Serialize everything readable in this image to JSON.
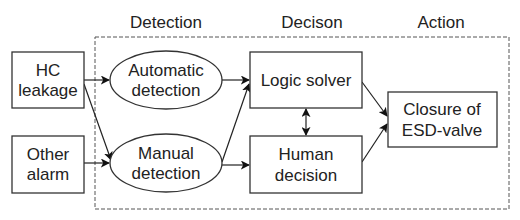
{
  "headers": {
    "detection": "Detection",
    "decision": "Decison",
    "action": "Action"
  },
  "nodes": {
    "hc_leakage": {
      "line1": "HC",
      "line2": "leakage"
    },
    "other_alarm": {
      "line1": "Other",
      "line2": "alarm"
    },
    "automatic_detection": {
      "line1": "Automatic",
      "line2": "detection"
    },
    "manual_detection": {
      "line1": "Manual",
      "line2": "detection"
    },
    "logic_solver": {
      "line1": "Logic solver"
    },
    "human_decision": {
      "line1": "Human",
      "line2": "decision"
    },
    "closure": {
      "line1": "Closure of",
      "line2": "ESD-valve"
    }
  },
  "edges": [
    {
      "from": "HC leakage",
      "to": "Automatic detection"
    },
    {
      "from": "HC leakage",
      "to": "Manual detection"
    },
    {
      "from": "Other alarm",
      "to": "Manual detection"
    },
    {
      "from": "Automatic detection",
      "to": "Logic solver"
    },
    {
      "from": "Manual detection",
      "to": "Logic solver"
    },
    {
      "from": "Manual detection",
      "to": "Human decision"
    },
    {
      "from": "Logic solver",
      "to": "Human decision",
      "bidirectional": true
    },
    {
      "from": "Logic solver",
      "to": "Closure of ESD-valve"
    },
    {
      "from": "Human decision",
      "to": "Closure of ESD-valve"
    }
  ]
}
